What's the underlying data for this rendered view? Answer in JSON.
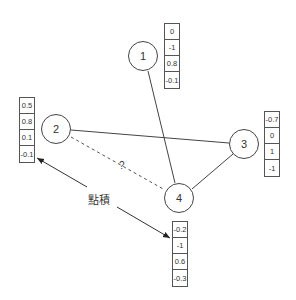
{
  "nodes": [
    {
      "id": "1",
      "label": "1",
      "vector": [
        "0",
        "-1",
        "0.8",
        "-0.1"
      ]
    },
    {
      "id": "2",
      "label": "2",
      "vector": [
        "0.5",
        "0.8",
        "0.1",
        "-0.1"
      ]
    },
    {
      "id": "3",
      "label": "3",
      "vector": [
        "-0.7",
        "0",
        "1",
        "-1"
      ]
    },
    {
      "id": "4",
      "label": "4",
      "vector": [
        "-0.2",
        "-1",
        "0.6",
        "-0.3"
      ]
    }
  ],
  "edges": [
    {
      "from": "1",
      "to": "4",
      "style": "solid"
    },
    {
      "from": "2",
      "to": "3",
      "style": "solid"
    },
    {
      "from": "3",
      "to": "4",
      "style": "solid"
    },
    {
      "from": "2",
      "to": "4",
      "style": "dashed",
      "label": "?"
    }
  ],
  "annotation": {
    "label": "點積",
    "arrows": [
      "vector-2",
      "vector-4"
    ]
  },
  "colors": {
    "stroke": "#444444",
    "text": "#333333"
  }
}
